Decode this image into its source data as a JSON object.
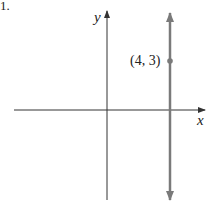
{
  "problem_number": "1.",
  "axes": {
    "x_label": "x",
    "y_label": "y"
  },
  "point": {
    "label": "(4, 3)",
    "x": 4,
    "y": 3
  },
  "line": {
    "equation": "x = 4",
    "type": "vertical"
  },
  "colors": {
    "axis": "#333333",
    "line": "#7a7a7a",
    "point": "#7a7a7a"
  }
}
